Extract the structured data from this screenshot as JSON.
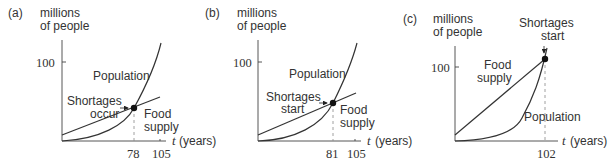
{
  "panels": [
    {
      "label": "(a)",
      "ylabel_line1": "millions",
      "ylabel_line2": "of people",
      "ytick": "100",
      "xaxis_var": "t",
      "xaxis_unit": "(years)",
      "xticks": [
        "78",
        "105"
      ],
      "curve_population": "Population",
      "curve_food_line1": "Food",
      "curve_food_line2": "supply",
      "annot_line1": "Shortages",
      "annot_line2": "occur"
    },
    {
      "label": "(b)",
      "ylabel_line1": "millions",
      "ylabel_line2": "of people",
      "ytick": "100",
      "xaxis_var": "t",
      "xaxis_unit": "(years)",
      "xticks": [
        "81",
        "105"
      ],
      "curve_population": "Population",
      "curve_food_line1": "Food",
      "curve_food_line2": "supply",
      "annot_line1": "Shortages",
      "annot_line2": "start"
    },
    {
      "label": "(c)",
      "ylabel_line1": "millions",
      "ylabel_line2": "of people",
      "ytick": "100",
      "xaxis_var": "t",
      "xaxis_unit": "(years)",
      "xticks": [
        "102"
      ],
      "curve_population": "Population",
      "curve_food_line1": "Food",
      "curve_food_line2": "supply",
      "annot_line1": "Shortages",
      "annot_line2": "start"
    }
  ]
}
